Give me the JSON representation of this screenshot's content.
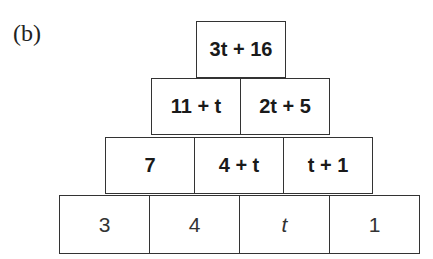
{
  "label": "(b)",
  "pyramid": {
    "rows": [
      [
        "3t + 16"
      ],
      [
        "11 + t",
        "2t + 5"
      ],
      [
        "7",
        "4 + t",
        "t + 1"
      ],
      [
        "3",
        "4",
        "t",
        "1"
      ]
    ]
  }
}
